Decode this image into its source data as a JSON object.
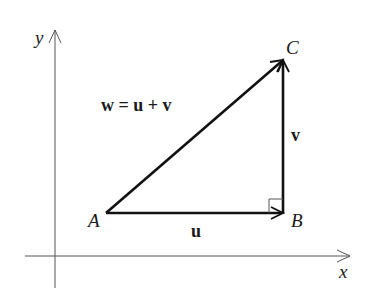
{
  "diagram": {
    "axes": {
      "x_label": "x",
      "y_label": "y"
    },
    "points": {
      "A": "A",
      "B": "B",
      "C": "C"
    },
    "vectors": {
      "u": "u",
      "v": "v",
      "w_equation": "w = u + v"
    },
    "colors": {
      "axis": "#555555",
      "vector": "#111111",
      "background": "#ffffff"
    }
  }
}
